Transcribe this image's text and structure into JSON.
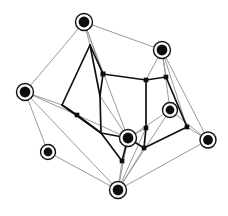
{
  "figure": {
    "name": "network-graph",
    "title": "",
    "background_color": "#ffffff",
    "width": 228,
    "height": 216
  },
  "style": {
    "outer_edge_color": "#9a9a9a",
    "outer_edge_width": 1.0,
    "inner_edge_color": "#111111",
    "inner_edge_width": 1.7,
    "hub_node_fill": "#0d0d0d",
    "hub_node_ring": "#111111",
    "square_node_fill": "#0d0d0d"
  },
  "graph_data": {
    "type": "node-link-diagram",
    "node_count": 20,
    "edge_count": 45,
    "nodes": [
      {
        "id": "h1",
        "label": "",
        "shape": "ring-circle",
        "x": 84,
        "y": 22,
        "r": 8.5,
        "group": "hub"
      },
      {
        "id": "h2",
        "label": "",
        "shape": "ring-circle",
        "x": 162,
        "y": 50,
        "r": 8.5,
        "group": "hub"
      },
      {
        "id": "h3",
        "label": "",
        "shape": "ring-circle",
        "x": 25,
        "y": 92,
        "r": 8.5,
        "group": "hub"
      },
      {
        "id": "h4",
        "label": "",
        "shape": "ring-circle",
        "x": 170,
        "y": 110,
        "r": 7.5,
        "group": "hub"
      },
      {
        "id": "h5",
        "label": "",
        "shape": "ring-circle",
        "x": 208,
        "y": 140,
        "r": 8.0,
        "group": "hub"
      },
      {
        "id": "h6",
        "label": "",
        "shape": "ring-circle",
        "x": 128,
        "y": 138,
        "r": 8.5,
        "group": "hub"
      },
      {
        "id": "h7",
        "label": "",
        "shape": "ring-circle",
        "x": 48,
        "y": 152,
        "r": 7.5,
        "group": "hub"
      },
      {
        "id": "h8",
        "label": "",
        "shape": "ring-circle",
        "x": 118,
        "y": 190,
        "r": 8.5,
        "group": "hub"
      },
      {
        "id": "s1",
        "label": "",
        "shape": "square",
        "x": 103,
        "y": 74,
        "s": 5.0,
        "group": "inner"
      },
      {
        "id": "s2",
        "label": "",
        "shape": "square",
        "x": 146,
        "y": 80,
        "s": 4.6,
        "group": "inner"
      },
      {
        "id": "s3",
        "label": "",
        "shape": "square",
        "x": 166,
        "y": 77,
        "s": 4.6,
        "group": "inner"
      },
      {
        "id": "s4",
        "label": "",
        "shape": "square",
        "x": 77,
        "y": 115,
        "s": 4.6,
        "group": "inner"
      },
      {
        "id": "s5",
        "label": "",
        "shape": "square",
        "x": 146,
        "y": 128,
        "s": 4.6,
        "group": "inner"
      },
      {
        "id": "s6",
        "label": "",
        "shape": "square",
        "x": 187,
        "y": 127,
        "s": 4.6,
        "group": "inner"
      },
      {
        "id": "s7",
        "label": "",
        "shape": "square",
        "x": 144,
        "y": 148,
        "s": 4.6,
        "group": "inner"
      },
      {
        "id": "s8",
        "label": "",
        "shape": "square",
        "x": 122,
        "y": 161,
        "s": 4.6,
        "group": "inner"
      },
      {
        "id": "c1",
        "label": "",
        "shape": "corner",
        "x": 90,
        "y": 45,
        "s": 0,
        "group": "corner"
      },
      {
        "id": "c2",
        "label": "",
        "shape": "corner",
        "x": 62,
        "y": 105,
        "s": 0,
        "group": "corner"
      },
      {
        "id": "c3",
        "label": "",
        "shape": "corner",
        "x": 101,
        "y": 133,
        "s": 0,
        "group": "corner"
      },
      {
        "id": "c4",
        "label": "",
        "shape": "corner",
        "x": 100,
        "y": 96,
        "s": 0,
        "group": "corner"
      }
    ],
    "edges": [
      {
        "source": "h1",
        "target": "h2",
        "class": "outer"
      },
      {
        "source": "h1",
        "target": "h3",
        "class": "outer"
      },
      {
        "source": "h1",
        "target": "c1",
        "class": "outer"
      },
      {
        "source": "h1",
        "target": "s1",
        "class": "outer"
      },
      {
        "source": "h1",
        "target": "h6",
        "class": "outer"
      },
      {
        "source": "h3",
        "target": "h7",
        "class": "outer"
      },
      {
        "source": "h3",
        "target": "h8",
        "class": "outer"
      },
      {
        "source": "h3",
        "target": "c2",
        "class": "outer"
      },
      {
        "source": "h3",
        "target": "s4",
        "class": "outer"
      },
      {
        "source": "h7",
        "target": "h8",
        "class": "outer"
      },
      {
        "source": "h8",
        "target": "h5",
        "class": "outer"
      },
      {
        "source": "h8",
        "target": "h6",
        "class": "outer"
      },
      {
        "source": "h8",
        "target": "s5",
        "class": "outer"
      },
      {
        "source": "h8",
        "target": "s7",
        "class": "outer"
      },
      {
        "source": "h8",
        "target": "s8",
        "class": "outer"
      },
      {
        "source": "h8",
        "target": "h4",
        "class": "outer"
      },
      {
        "source": "h2",
        "target": "s2",
        "class": "outer"
      },
      {
        "source": "h2",
        "target": "s3",
        "class": "outer"
      },
      {
        "source": "h2",
        "target": "h4",
        "class": "outer"
      },
      {
        "source": "h2",
        "target": "h5",
        "class": "outer"
      },
      {
        "source": "h2",
        "target": "s6",
        "class": "outer"
      },
      {
        "source": "h5",
        "target": "s6",
        "class": "outer"
      },
      {
        "source": "h5",
        "target": "h4",
        "class": "outer"
      },
      {
        "source": "h6",
        "target": "s5",
        "class": "outer"
      },
      {
        "source": "h6",
        "target": "h4",
        "class": "outer"
      },
      {
        "source": "h6",
        "target": "c4",
        "class": "outer"
      },
      {
        "source": "h6",
        "target": "s4",
        "class": "outer"
      },
      {
        "source": "c1",
        "target": "s1",
        "class": "inner"
      },
      {
        "source": "c1",
        "target": "c2",
        "class": "inner"
      },
      {
        "source": "c1",
        "target": "c4",
        "class": "inner"
      },
      {
        "source": "c2",
        "target": "s4",
        "class": "inner"
      },
      {
        "source": "c2",
        "target": "c3",
        "class": "inner"
      },
      {
        "source": "s4",
        "target": "c3",
        "class": "inner"
      },
      {
        "source": "c4",
        "target": "c3",
        "class": "inner"
      },
      {
        "source": "c4",
        "target": "s1",
        "class": "inner"
      },
      {
        "source": "s1",
        "target": "s2",
        "class": "inner"
      },
      {
        "source": "s2",
        "target": "s3",
        "class": "inner"
      },
      {
        "source": "s2",
        "target": "s5",
        "class": "inner"
      },
      {
        "source": "s3",
        "target": "s6",
        "class": "inner"
      },
      {
        "source": "s5",
        "target": "s7",
        "class": "inner"
      },
      {
        "source": "s7",
        "target": "s6",
        "class": "inner"
      },
      {
        "source": "s7",
        "target": "h6",
        "class": "inner"
      },
      {
        "source": "c3",
        "target": "h6",
        "class": "inner"
      },
      {
        "source": "c3",
        "target": "s8",
        "class": "inner"
      },
      {
        "source": "s8",
        "target": "h6",
        "class": "inner"
      }
    ]
  }
}
